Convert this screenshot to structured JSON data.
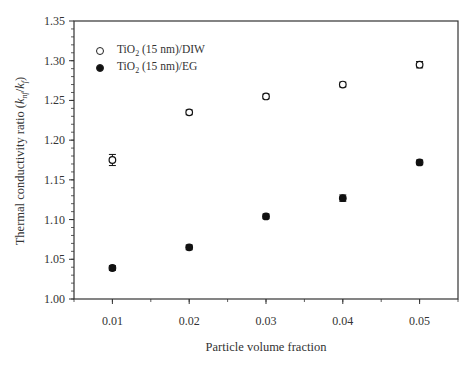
{
  "chart_data": {
    "type": "scatter",
    "title": "",
    "xlabel": "Particle volume fraction",
    "ylabel": "Thermal conductivity ratio (k_nf/k_f)",
    "ylabel_parts": {
      "prefix": "Thermal conductivity ratio (",
      "k1": "k",
      "sub1": "nf",
      "slash": "/",
      "k2": "k",
      "sub2": "f",
      "suffix": ")"
    },
    "x": [
      0.01,
      0.02,
      0.03,
      0.04,
      0.05
    ],
    "x_tick_labels": [
      "0.01",
      "0.02",
      "0.03",
      "0.04",
      "0.05"
    ],
    "y_tick_labels": [
      "1.00",
      "1.05",
      "1.10",
      "1.15",
      "1.20",
      "1.25",
      "1.30",
      "1.35"
    ],
    "xlim": [
      0.005,
      0.055
    ],
    "ylim": [
      1.0,
      1.35
    ],
    "grid": false,
    "legend_position": "upper left",
    "series": [
      {
        "name": "TiO2 (15 nm)/DIW",
        "label_main": "TiO",
        "label_sub": "2",
        "label_rest": " (15 nm)/DIW",
        "marker": "open-circle",
        "values": [
          1.175,
          1.235,
          1.255,
          1.27,
          1.295
        ],
        "errors": [
          0.007,
          0.003,
          0.003,
          0.003,
          0.004
        ]
      },
      {
        "name": "TiO2 (15 nm)/EG",
        "label_main": "TiO",
        "label_sub": "2",
        "label_rest": " (15 nm)/EG",
        "marker": "filled-circle",
        "values": [
          1.039,
          1.065,
          1.104,
          1.127,
          1.172
        ],
        "errors": [
          0.003,
          0.003,
          0.003,
          0.004,
          0.003
        ]
      }
    ]
  },
  "colors": {
    "axis": "#333333",
    "marker": "#111111",
    "background": "#ffffff"
  }
}
